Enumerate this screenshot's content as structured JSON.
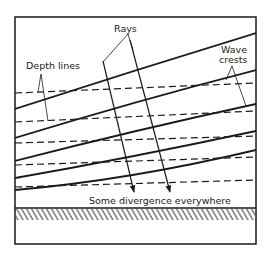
{
  "figure": {
    "labels": {
      "depth_lines": "Depth lines",
      "rays": "Rays",
      "wave_crests_line1": "Wave",
      "wave_crests_line2": "crests",
      "caption": "Some divergence everywhere"
    },
    "colors": {
      "ink": "#1a1a1a",
      "background": "#ffffff"
    },
    "frame": {
      "left": 15,
      "top": 17,
      "right": 256,
      "bottom": 244
    },
    "shoreline": {
      "y": 208,
      "hatch_bottom": 220
    },
    "wave_crests": [
      {
        "x1": 15,
        "y1": 109,
        "x2": 256,
        "y2": 33
      },
      {
        "x1": 15,
        "y1": 138,
        "x2": 256,
        "y2": 70
      },
      {
        "x1": 15,
        "y1": 161,
        "x2": 256,
        "y2": 104
      },
      {
        "x1": 15,
        "y1": 178,
        "x2": 256,
        "y2": 131
      },
      {
        "x1": 15,
        "y1": 188,
        "x2": 256,
        "y2": 150
      }
    ],
    "depth_lines": [
      {
        "x1": 15,
        "y1": 93,
        "x2": 256,
        "y2": 83
      },
      {
        "x1": 15,
        "y1": 122,
        "x2": 256,
        "y2": 111
      },
      {
        "x1": 15,
        "y1": 143,
        "x2": 256,
        "y2": 136
      },
      {
        "x1": 15,
        "y1": 165,
        "x2": 256,
        "y2": 157
      },
      {
        "x1": 15,
        "y1": 187,
        "x2": 256,
        "y2": 180
      }
    ],
    "rays": [
      {
        "x1": 103,
        "y1": 61,
        "x2": 134,
        "y2": 192
      },
      {
        "x1": 130,
        "y1": 40,
        "x2": 170,
        "y2": 192
      }
    ]
  }
}
